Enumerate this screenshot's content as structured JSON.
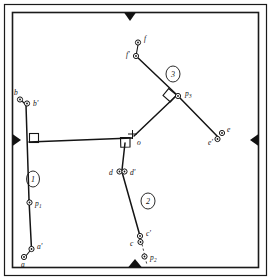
{
  "figure": {
    "width": 271,
    "height": 280,
    "background_color": "#ffffff",
    "ink_color": "#141414"
  },
  "frame": {
    "name": "outer-border",
    "style": "double-rule rectangle",
    "edge_markers": [
      {
        "name": "top-marker",
        "label": "▼",
        "edge": "top",
        "direction": "down"
      },
      {
        "name": "left-marker",
        "label": "▶",
        "edge": "left",
        "direction": "right"
      },
      {
        "name": "right-marker",
        "label": "◀",
        "edge": "right",
        "direction": "left"
      },
      {
        "name": "bottom-marker",
        "label": "▲",
        "edge": "bottom",
        "direction": "up"
      }
    ]
  },
  "links": [
    {
      "id": "link-1",
      "badge": "1",
      "badge_x": 33,
      "badge_y": 179,
      "description": "left vertical link from a-a' up to b-b'"
    },
    {
      "id": "link-2",
      "badge": "2",
      "badge_x": 148,
      "badge_y": 201,
      "description": "lower centre link from d-d' down to c-c'"
    },
    {
      "id": "link-3",
      "badge": "3",
      "badge_x": 173,
      "badge_y": 74,
      "description": "upper right link from f-f' down through p3"
    }
  ],
  "points": [
    {
      "id": "b",
      "label": "b",
      "x": 20,
      "y": 99,
      "label_dx": -3,
      "label_dy": -4,
      "type": "pin"
    },
    {
      "id": "bp",
      "label": "b'",
      "x": 27,
      "y": 103,
      "label_dx": 5,
      "label_dy": 2,
      "type": "pin"
    },
    {
      "id": "a",
      "label": "a",
      "x": 24,
      "y": 258,
      "label_dx": -2,
      "label_dy": 8,
      "type": "pin"
    },
    {
      "id": "ap",
      "label": "a'",
      "x": 31,
      "y": 250,
      "label_dx": 5,
      "label_dy": -1,
      "type": "pin"
    },
    {
      "id": "p1",
      "label": "p",
      "sub": "1",
      "x": 31,
      "y": 203,
      "label_dx": 5,
      "label_dy": 3,
      "type": "center"
    },
    {
      "id": "d",
      "label": "d",
      "x": 119,
      "y": 172,
      "label_dx": -9,
      "label_dy": 2,
      "type": "pin"
    },
    {
      "id": "dp",
      "label": "d'",
      "x": 124,
      "y": 172,
      "label_dx": 5,
      "label_dy": 2,
      "type": "pin"
    },
    {
      "id": "c",
      "label": "c",
      "x": 139,
      "y": 242,
      "label_dx": -9,
      "label_dy": 3,
      "type": "pin"
    },
    {
      "id": "cp",
      "label": "c'",
      "x": 141,
      "y": 236,
      "label_dx": 5,
      "label_dy": -1,
      "type": "pin"
    },
    {
      "id": "p2",
      "label": "p",
      "sub": "2",
      "x": 145,
      "y": 257,
      "label_dx": 5,
      "label_dy": 3,
      "type": "center"
    },
    {
      "id": "f",
      "label": "f",
      "x": 138,
      "y": 42,
      "label_dx": 5,
      "label_dy": -2,
      "type": "pin"
    },
    {
      "id": "fp",
      "label": "f'",
      "x": 135,
      "y": 56,
      "label_dx": -9,
      "label_dy": 1,
      "type": "pin"
    },
    {
      "id": "e",
      "label": "e",
      "x": 222,
      "y": 133,
      "label_dx": 5,
      "label_dy": -2,
      "type": "pin"
    },
    {
      "id": "ep",
      "label": "e'",
      "x": 217,
      "y": 139,
      "label_dx": -9,
      "label_dy": 5,
      "type": "pin"
    },
    {
      "id": "p3",
      "label": "p",
      "sub": "3",
      "x": 178,
      "y": 96,
      "label_dx": 6,
      "label_dy": -1,
      "type": "center"
    },
    {
      "id": "o",
      "label": "o",
      "x": 134,
      "y": 139,
      "label_dx": 4,
      "label_dy": 7,
      "type": "origin"
    }
  ],
  "annotations": {
    "right_angle_marks": [
      {
        "name": "right-angle-at-left-link",
        "x": 30,
        "y": 137
      },
      {
        "name": "right-angle-at-o",
        "x": 120,
        "y": 141
      },
      {
        "name": "right-angle-at-p3",
        "x": 169,
        "y": 91
      }
    ],
    "origin_cross": {
      "name": "origin-cross-mark",
      "x": 132,
      "y": 134
    }
  }
}
